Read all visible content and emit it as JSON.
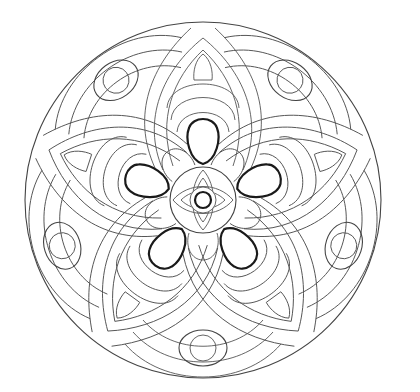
{
  "image": {
    "description": "Mandala coloring page line art",
    "width": 420,
    "height": 392,
    "background": "#ffffff",
    "line_color": "#444444",
    "bold_line_color": "#1a1a1a"
  },
  "mandala": {
    "center": [
      203,
      200
    ],
    "outer_radius": 178,
    "symmetry": 5,
    "petal_angles_deg": [
      0,
      72,
      144,
      216,
      288
    ],
    "ornament_angles_deg": [
      36,
      108,
      180,
      252,
      324
    ],
    "center_medallion": {
      "radius": 33,
      "eye_motif": true,
      "core_circle_radius": 8
    },
    "inner_flower": {
      "bold_teardrops": 5,
      "round_lobes": 5
    },
    "ring_ornaments": {
      "count": 5,
      "distance_from_center": 148,
      "inner_circle_radius": 13,
      "outer_oval": [
        24,
        18
      ]
    }
  }
}
